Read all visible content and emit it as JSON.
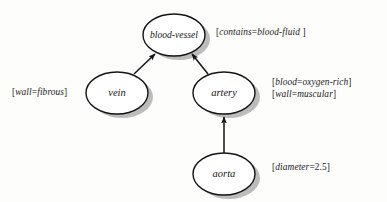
{
  "diagram": {
    "background_color": "#fdfdfc",
    "node_stroke_color": "#141414",
    "node_fill_color": "#ffffff",
    "shadow_color": "#b9b9b9",
    "edge_color": "#141414",
    "nodes": [
      {
        "id": "blood-vessel",
        "label": "blood-vessel",
        "cx": 174,
        "cy": 35,
        "rx": 31,
        "ry": 21,
        "label_size": "small"
      },
      {
        "id": "vein",
        "label": "vein",
        "cx": 117,
        "cy": 93,
        "rx": 31,
        "ry": 21,
        "label_size": "normal"
      },
      {
        "id": "artery",
        "label": "artery",
        "cx": 224,
        "cy": 93,
        "rx": 31,
        "ry": 21,
        "label_size": "normal"
      },
      {
        "id": "aorta",
        "label": "aorta",
        "cx": 224,
        "cy": 174,
        "rx": 31,
        "ry": 21,
        "label_size": "normal"
      }
    ],
    "edges": [
      {
        "id": "vein-to-blood-vessel",
        "from": "vein",
        "to": "blood-vessel"
      },
      {
        "id": "artery-to-blood-vessel",
        "from": "artery",
        "to": "blood-vessel"
      },
      {
        "id": "aorta-to-artery",
        "from": "aorta",
        "to": "artery"
      }
    ],
    "annotations": [
      {
        "id": "blood-vessel-attributes",
        "target": "blood-vessel",
        "lines": [
          {
            "open": "[",
            "key": "contains",
            "eq": "=",
            "value": "blood-fluid",
            "close": " ]"
          }
        ]
      },
      {
        "id": "vein-attributes",
        "target": "vein",
        "lines": [
          {
            "open": "[",
            "key": "wall",
            "eq": "=",
            "value": "fibrous",
            "close": "]"
          }
        ]
      },
      {
        "id": "artery-attributes",
        "target": "artery",
        "lines": [
          {
            "open": "[",
            "key": "blood",
            "eq": "=",
            "value": "oxygen-rich",
            "close": "]"
          },
          {
            "open": "[",
            "key": "wall",
            "eq": "=",
            "value": "muscular",
            "close": "]"
          }
        ]
      },
      {
        "id": "aorta-attributes",
        "target": "aorta",
        "lines": [
          {
            "open": "[",
            "key": "diameter",
            "eq": "=",
            "value": "2.5",
            "close": "]"
          }
        ]
      }
    ]
  }
}
